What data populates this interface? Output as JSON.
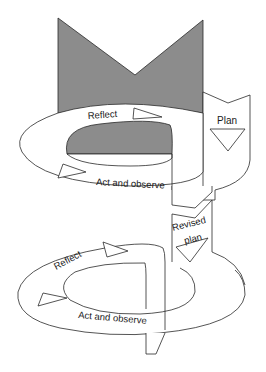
{
  "diagram": {
    "type": "action-research-spiral",
    "colors": {
      "fill_gray": "#8c8c8c",
      "stroke": "#2a2a2a",
      "background": "#ffffff"
    },
    "cycle1": {
      "reflect_label": "Reflect",
      "act_label": "Act and observe",
      "plan_label": "Plan"
    },
    "cycle2": {
      "revised_plan_line1": "Revised",
      "revised_plan_line2": "plan",
      "reflect_label": "Reflect",
      "act_label": "Act and observe"
    }
  }
}
